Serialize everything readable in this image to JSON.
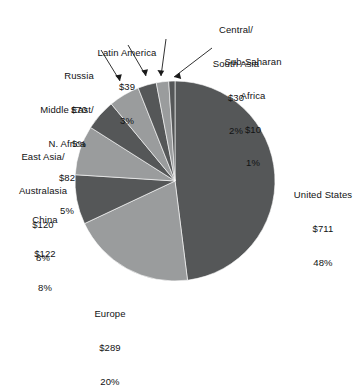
{
  "chart_data": {
    "type": "pie",
    "title": "",
    "subtitle": "",
    "units": "billions of USD",
    "value_prefix": "$",
    "legend_position": "outside-labels",
    "grid": false,
    "total_value": 1473,
    "categories": [
      "United States",
      "Europe",
      "China",
      "East Asia/\nAustralasia",
      "Middle East/\nN. Africa",
      "Russia",
      "Latin America",
      "Central/\nSouth Asia",
      "Sub-Saharan\nAfrica"
    ],
    "values": [
      711,
      289,
      122,
      120,
      82,
      70,
      39,
      30,
      10
    ],
    "percentages": [
      48,
      20,
      8,
      8,
      5,
      5,
      3,
      2,
      1
    ],
    "colors": [
      "#555758",
      "#9a9c9d",
      "#555758",
      "#9a9c9d",
      "#555758",
      "#9a9c9d",
      "#555758",
      "#9a9c9d",
      "#555758"
    ],
    "slices": [
      {
        "name": "United States",
        "label_lines": [
          "United States",
          "$711",
          "48%"
        ],
        "value": 711,
        "percent": 48,
        "color": "#555758",
        "start_deg": 0,
        "sweep_deg": 172.8,
        "has_leader": false
      },
      {
        "name": "Europe",
        "label_lines": [
          "Europe",
          "$289",
          "20%"
        ],
        "value": 289,
        "percent": 20,
        "color": "#9a9c9d",
        "start_deg": 172.8,
        "sweep_deg": 72.0,
        "has_leader": false
      },
      {
        "name": "China",
        "label_lines": [
          "China",
          "$122",
          "8%"
        ],
        "value": 122,
        "percent": 8,
        "color": "#555758",
        "start_deg": 244.8,
        "sweep_deg": 28.8,
        "has_leader": false
      },
      {
        "name": "East Asia/Australasia",
        "label_lines": [
          "East Asia/",
          "Australasia",
          "$120",
          "8%"
        ],
        "value": 120,
        "percent": 8,
        "color": "#9a9c9d",
        "start_deg": 273.6,
        "sweep_deg": 28.8,
        "has_leader": false
      },
      {
        "name": "Middle East/N. Africa",
        "label_lines": [
          "Middle East/",
          "N. Africa",
          "$82",
          "5%"
        ],
        "value": 82,
        "percent": 5,
        "color": "#555758",
        "start_deg": 302.4,
        "sweep_deg": 18.0,
        "has_leader": false
      },
      {
        "name": "Russia",
        "label_lines": [
          "Russia",
          "$70",
          "5%"
        ],
        "value": 70,
        "percent": 5,
        "color": "#9a9c9d",
        "start_deg": 320.4,
        "sweep_deg": 18.0,
        "has_leader": true
      },
      {
        "name": "Latin America",
        "label_lines": [
          "Latin America",
          "$39",
          "3%"
        ],
        "value": 39,
        "percent": 3,
        "color": "#555758",
        "start_deg": 338.4,
        "sweep_deg": 10.8,
        "has_leader": true
      },
      {
        "name": "Central/South Asia",
        "label_lines": [
          "Central/",
          "South Asia",
          "$30",
          "2%"
        ],
        "value": 30,
        "percent": 2,
        "color": "#9a9c9d",
        "start_deg": 349.2,
        "sweep_deg": 7.2,
        "has_leader": true
      },
      {
        "name": "Sub-Saharan Africa",
        "label_lines": [
          "Sub-Saharan",
          "Africa",
          "$10",
          "1%"
        ],
        "value": 10,
        "percent": 1,
        "color": "#555758",
        "start_deg": 356.4,
        "sweep_deg": 3.6,
        "has_leader": true
      }
    ]
  },
  "labels": {
    "united_states": {
      "l1": "United States",
      "l2": "$711",
      "l3": "48%"
    },
    "europe": {
      "l1": "Europe",
      "l2": "$289",
      "l3": "20%"
    },
    "china": {
      "l1": "China",
      "l2": "$122",
      "l3": "8%"
    },
    "east_asia": {
      "l1": "East Asia/",
      "l2": "Australasia",
      "l3": "$120",
      "l4": "8%"
    },
    "middle_east": {
      "l1": "Middle East/",
      "l2": "N. Africa",
      "l3": "$82",
      "l4": "5%"
    },
    "russia": {
      "l1": "Russia",
      "l2": "$70",
      "l3": "5%"
    },
    "latin_america": {
      "l1": "Latin America",
      "l2": "$39",
      "l3": "3%"
    },
    "central_south_asia": {
      "l1": "Central/",
      "l2": "South Asia",
      "l3": "$30",
      "l4": "2%"
    },
    "sub_saharan_africa": {
      "l1": "Sub-Saharan",
      "l2": "Africa",
      "l3": "$10",
      "l4": "1%"
    }
  },
  "colors": {
    "dark_slice": "#555758",
    "light_slice": "#9a9c9d",
    "text": "#111213",
    "background": "#ffffff",
    "leader_line": "#1a1a1a"
  }
}
